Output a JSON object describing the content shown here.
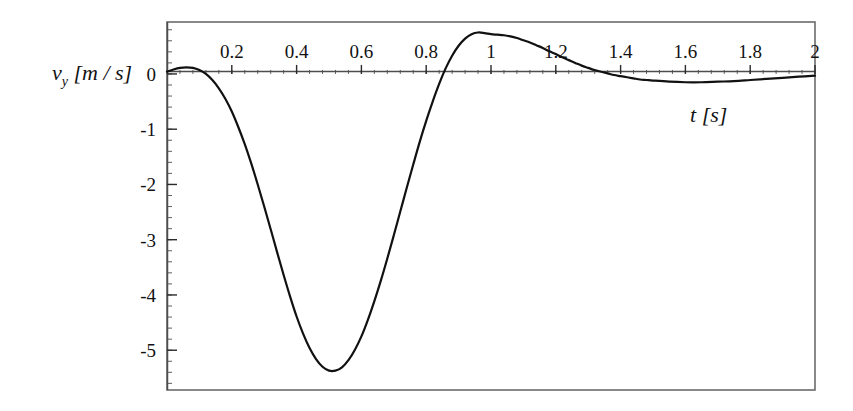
{
  "figure": {
    "background_color": "#ffffff",
    "frame_color": "#585858",
    "curve_color": "#111111",
    "axis_color": "#555555"
  },
  "axes": {
    "y_label_var": "v",
    "y_label_sub": "y",
    "y_label_unit": "[m / s]",
    "y_label_full": "v_y [m / s]",
    "x_label_var": "t",
    "x_label_unit": "[s]",
    "x_label_full": "t [s]"
  },
  "ticks": {
    "x_major_labels": [
      "0.2",
      "0.4",
      "0.6",
      "0.8",
      "1",
      "1.2",
      "1.4",
      "1.6",
      "1.8",
      "2"
    ],
    "x_major_values": [
      0.2,
      0.4,
      0.6,
      0.8,
      1,
      1.2,
      1.4,
      1.6,
      1.8,
      2
    ],
    "y_major_labels": [
      "0",
      "-1",
      "-2",
      "-3",
      "-4",
      "-5"
    ],
    "y_major_values": [
      0,
      -1,
      -2,
      -3,
      -4,
      -5
    ]
  },
  "chart_data": {
    "type": "line",
    "title": "",
    "subtitle": "",
    "xlabel": "t [s]",
    "ylabel": "v_y [m / s]",
    "xlim": [
      0,
      2
    ],
    "ylim": [
      -5.72,
      0.94
    ],
    "grid": false,
    "legend": null,
    "x_tick_labels": [
      "0.2",
      "0.4",
      "0.6",
      "0.8",
      "1",
      "1.2",
      "1.4",
      "1.6",
      "1.8",
      "2"
    ],
    "y_tick_labels": [
      "0",
      "-1",
      "-2",
      "-3",
      "-4",
      "-5"
    ],
    "x_minor_tick_step": 0.04,
    "y_minor_tick_step": 0.2,
    "annotations": [
      "damped oscillation decaying toward zero",
      "global minimum approximately -5.6 near t = 0.43 s",
      "local maximum approximately +0.72 near t = 1.03 s"
    ],
    "series": [
      {
        "name": "v_y(t)",
        "color": "#111111",
        "line_width": 2.2,
        "x": [
          0.0,
          0.02,
          0.04,
          0.06,
          0.08,
          0.1,
          0.12,
          0.14,
          0.16,
          0.18,
          0.2,
          0.22,
          0.24,
          0.26,
          0.28,
          0.3,
          0.32,
          0.34,
          0.36,
          0.38,
          0.4,
          0.42,
          0.44,
          0.46,
          0.48,
          0.5,
          0.52,
          0.54,
          0.56,
          0.58,
          0.6,
          0.62,
          0.64,
          0.66,
          0.68,
          0.7,
          0.72,
          0.74,
          0.76,
          0.78,
          0.8,
          0.82,
          0.84,
          0.86,
          0.88,
          0.9,
          0.92,
          0.94,
          0.96,
          0.98,
          1.0,
          1.02,
          1.04,
          1.06,
          1.08,
          1.1,
          1.12,
          1.14,
          1.16,
          1.18,
          1.2,
          1.22,
          1.24,
          1.26,
          1.28,
          1.3,
          1.32,
          1.34,
          1.36,
          1.38,
          1.4,
          1.42,
          1.44,
          1.46,
          1.48,
          1.5,
          1.55,
          1.6,
          1.65,
          1.7,
          1.75,
          1.8,
          1.85,
          1.9,
          1.95,
          2.0
        ],
        "y": [
          0.04,
          0.08,
          0.11,
          0.12,
          0.11,
          0.07,
          0.0,
          -0.11,
          -0.26,
          -0.45,
          -0.68,
          -0.96,
          -1.27,
          -1.62,
          -2.0,
          -2.4,
          -2.81,
          -3.23,
          -3.64,
          -4.03,
          -4.39,
          -4.7,
          -4.96,
          -5.16,
          -5.3,
          -5.37,
          -5.37,
          -5.31,
          -5.18,
          -4.99,
          -4.75,
          -4.45,
          -4.11,
          -3.74,
          -3.34,
          -2.92,
          -2.49,
          -2.06,
          -1.64,
          -1.23,
          -0.85,
          -0.5,
          -0.18,
          0.1,
          0.33,
          0.51,
          0.64,
          0.72,
          0.75,
          0.74,
          0.72,
          0.71,
          0.7,
          0.68,
          0.65,
          0.61,
          0.57,
          0.52,
          0.47,
          0.41,
          0.36,
          0.3,
          0.25,
          0.2,
          0.15,
          0.11,
          0.07,
          0.04,
          0.01,
          -0.02,
          -0.04,
          -0.06,
          -0.08,
          -0.1,
          -0.11,
          -0.12,
          -0.14,
          -0.15,
          -0.15,
          -0.14,
          -0.13,
          -0.11,
          -0.09,
          -0.07,
          -0.05,
          -0.03
        ]
      }
    ]
  }
}
